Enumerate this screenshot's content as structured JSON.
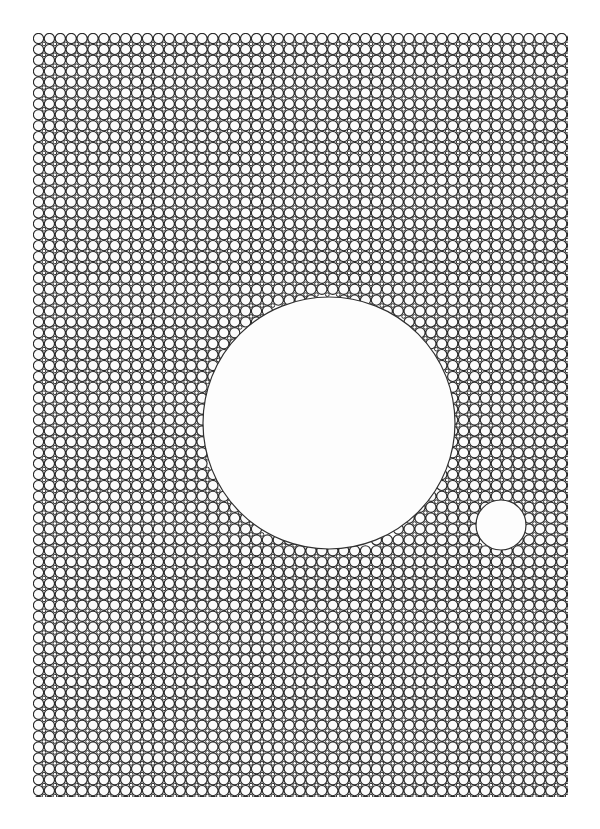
{
  "figure": {
    "canvas": {
      "width": 600,
      "height": 829,
      "background": "#ffffff"
    }
  },
  "chart_data": {
    "type": "scatter",
    "subtitle": "",
    "xlabel": "",
    "ylabel": "",
    "xlim": [
      0,
      600
    ],
    "ylim": [
      0,
      829
    ],
    "grid": false,
    "legend_position": "none",
    "tick_labels": {
      "x": [],
      "y": []
    },
    "annotations": [],
    "lattice": {
      "kind": "square",
      "pitch_x": 10.9,
      "pitch_y": 10.9,
      "circle_radius": 5.1,
      "interstitial_radius": 1.85,
      "origin_x": 38.5,
      "origin_y": 38.5,
      "columns": 50,
      "rows": 71,
      "field_left": 33,
      "field_top": 33,
      "field_right": 568,
      "field_bottom": 797
    },
    "voids": [
      {
        "name": "large-void",
        "cx": 329,
        "cy": 423,
        "r": 126
      },
      {
        "name": "small-void",
        "cx": 501,
        "cy": 525,
        "r": 25
      }
    ],
    "series": [
      {
        "name": "lattice-circles",
        "values": [],
        "stroke": "#2b2b2b",
        "fill": "#fbfbfb",
        "stroke_width": 1.15
      },
      {
        "name": "interstitial-circles",
        "values": [],
        "stroke": "#2b2b2b",
        "fill": "#ffffff",
        "stroke_width": 1.0
      },
      {
        "name": "void-outlines",
        "values": [],
        "stroke": "#2f2f2f",
        "fill": "#fdfdfd",
        "stroke_width": 1.2
      }
    ]
  },
  "colors": {
    "stroke": "#2b2b2b",
    "circle_fill": "#fbfbfb",
    "void_fill": "#fdfdfd",
    "void_stroke": "#2f2f2f",
    "background": "#ffffff"
  }
}
